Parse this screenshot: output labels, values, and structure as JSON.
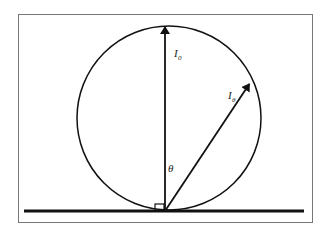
{
  "diagram": {
    "labels": {
      "normal_intensity": {
        "main": "I",
        "sub": "0"
      },
      "angled_intensity": {
        "main": "I",
        "sub": "θ"
      },
      "angle": "θ"
    },
    "angle_deg": 30,
    "colors": {
      "stroke": "#111111",
      "frame": "#777777",
      "background": "#ffffff"
    }
  }
}
